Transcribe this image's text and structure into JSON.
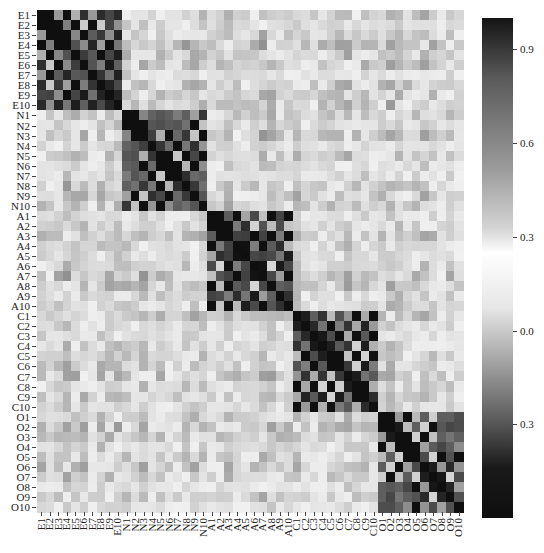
{
  "chart_data": {
    "type": "heatmap",
    "title": "",
    "xlabel": "",
    "ylabel": "",
    "labels": [
      "E1",
      "E2",
      "E3",
      "E4",
      "E5",
      "E6",
      "E7",
      "E8",
      "E9",
      "E10",
      "N1",
      "N2",
      "N3",
      "N4",
      "N5",
      "N6",
      "N7",
      "N8",
      "N9",
      "N10",
      "A1",
      "A2",
      "A3",
      "A4",
      "A5",
      "A6",
      "A7",
      "A8",
      "A9",
      "A10",
      "C1",
      "C2",
      "C3",
      "C4",
      "C5",
      "C6",
      "C7",
      "C8",
      "C9",
      "C10",
      "O1",
      "O2",
      "O3",
      "O4",
      "O5",
      "O6",
      "O7",
      "O8",
      "O9",
      "O10"
    ],
    "colorbar": {
      "ticks": [
        {
          "label": "0.9",
          "value": 0.9
        },
        {
          "label": "0.6",
          "value": 0.6
        },
        {
          "label": "0.3",
          "value": 0.3
        },
        {
          "label": "0.0",
          "value": 0.0
        },
        {
          "label": "0.3",
          "value": -0.3
        }
      ],
      "range": [
        -0.6,
        1.0
      ],
      "colormap": "diverging gray (dark at high and low, white near 0.25)"
    },
    "grid": false,
    "legend_position": "right",
    "block_structure": {
      "blocks": [
        "E",
        "N",
        "A",
        "C",
        "O"
      ],
      "within_block_alternating_sign": true,
      "diagonal": 1.0
    }
  }
}
